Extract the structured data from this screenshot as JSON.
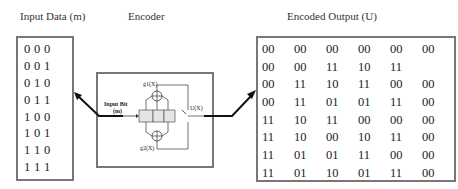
{
  "labels": {
    "input": "Input Data (m)",
    "encoder": "Encoder",
    "output": "Encoded Output (U)"
  },
  "encoder": {
    "input_bit_label": "Input Bit",
    "input_bit_symbol": "(m)",
    "g1": "g1(X)",
    "g2": "g2(X)",
    "output_symbol": "U(X)",
    "register_cells": 3
  },
  "input_rows": [
    [
      "0",
      "0",
      "0"
    ],
    [
      "0",
      "0",
      "1"
    ],
    [
      "0",
      "1",
      "0"
    ],
    [
      "0",
      "1",
      "1"
    ],
    [
      "1",
      "0",
      "0"
    ],
    [
      "1",
      "0",
      "1"
    ],
    [
      "1",
      "1",
      "0"
    ],
    [
      "1",
      "1",
      "1"
    ]
  ],
  "output_rows": [
    [
      "00",
      "00",
      "00",
      "00",
      "00",
      "00"
    ],
    [
      "00",
      "00",
      "11",
      "10",
      "11",
      ""
    ],
    [
      "00",
      "11",
      "10",
      "11",
      "00",
      "00"
    ],
    [
      "00",
      "11",
      "01",
      "01",
      "11",
      "00"
    ],
    [
      "11",
      "10",
      "11",
      "00",
      "00",
      "00"
    ],
    [
      "11",
      "10",
      "00",
      "10",
      "11",
      "00"
    ],
    [
      "11",
      "01",
      "01",
      "11",
      "00",
      "00"
    ],
    [
      "11",
      "01",
      "10",
      "01",
      "11",
      "00"
    ]
  ],
  "colors": {
    "border": "#777777",
    "register_fill": "#e4e4e4",
    "arrow": "#111111"
  }
}
